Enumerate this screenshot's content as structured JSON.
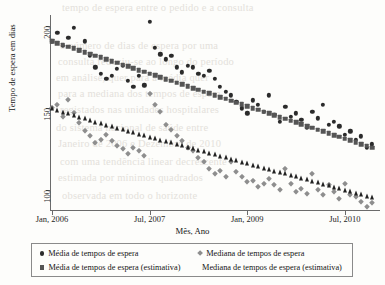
{
  "figure": {
    "background_color": "#fdfdfb",
    "y_axis_title": "Tempo de espera em dias",
    "x_axis_title": "Mês, Ano"
  },
  "bleed_text": [
    {
      "x": 62,
      "y": 2,
      "text": "tempo de espera entre o pedido e a consulta"
    },
    {
      "x": 60,
      "y": 40,
      "text": "o número de dias de espera por uma"
    },
    {
      "x": 58,
      "y": 56,
      "text": "consulta reduziu-se ao longo do período"
    },
    {
      "x": 56,
      "y": 72,
      "text": "em análise, quer para a média quer"
    },
    {
      "x": 58,
      "y": 88,
      "text": "para a mediana dos tempos de espera"
    },
    {
      "x": 60,
      "y": 104,
      "text": "registados nas unidades hospitalares"
    },
    {
      "x": 56,
      "y": 122,
      "text": "do sistema nacional de saúde entre"
    },
    {
      "x": 58,
      "y": 138,
      "text": "Janeiro de 2006 e Dezembro de 2010"
    },
    {
      "x": 60,
      "y": 156,
      "text": "com uma tendência linear decrescente"
    },
    {
      "x": 58,
      "y": 172,
      "text": "estimada por mínimos quadrados"
    },
    {
      "x": 62,
      "y": 190,
      "text": "observada em todo o horizonte"
    }
  ],
  "legend": {
    "entries": [
      {
        "marker": "circle-marker-icon",
        "color": "#2b2b2b",
        "label": "Média de tempos de espera",
        "x": 8,
        "y": 5
      },
      {
        "marker": "square-marker-icon",
        "color": "#555555",
        "label": "Média de tempos de espera (estimativa)",
        "x": 8,
        "y": 19
      },
      {
        "marker": "diamond-marker-icon",
        "color": "#8e8e8e",
        "label": "Mediana de tempos de espera",
        "x": 166,
        "y": 5
      },
      {
        "marker": "triangle-marker-icon",
        "color": "#222222",
        "label": "Mediana de tempos de espera (estimativa)",
        "x": 166,
        "y": 19
      }
    ]
  },
  "chart_data": {
    "type": "scatter",
    "title": "",
    "xlabel": "Mês, Ano",
    "ylabel": "Tempo de espera em dias",
    "xlim": [
      0,
      59
    ],
    "ylim": [
      88,
      207
    ],
    "grid": false,
    "legend_position": "bottom",
    "x_ticks": [
      {
        "value": 0,
        "label": "Jan, 2006"
      },
      {
        "value": 18,
        "label": "Jul, 2007"
      },
      {
        "value": 36,
        "label": "Jan, 2009"
      },
      {
        "value": 54,
        "label": "Jul, 2010"
      }
    ],
    "y_ticks": [
      {
        "value": 200,
        "label": "200"
      },
      {
        "value": 150,
        "label": "150"
      },
      {
        "value": 100,
        "label": "100"
      }
    ],
    "series": [
      {
        "name": "Média de tempos de espera",
        "marker": "circle",
        "color": "#2b2b2b",
        "size": 4.3,
        "x": [
          0,
          1,
          2,
          3,
          4,
          5,
          6,
          7,
          8,
          9,
          10,
          11,
          12,
          13,
          14,
          15,
          16,
          17,
          18,
          19,
          20,
          21,
          22,
          23,
          24,
          25,
          26,
          27,
          28,
          29,
          30,
          31,
          32,
          33,
          34,
          35,
          36,
          37,
          38,
          39,
          40,
          41,
          42,
          43,
          44,
          45,
          46,
          47,
          48,
          49,
          50,
          51,
          52,
          53,
          54,
          55,
          56,
          57,
          58,
          59
        ],
        "values": [
          191,
          196,
          188,
          193,
          199,
          185,
          191,
          182,
          175,
          171,
          168,
          170,
          174,
          176,
          167,
          163,
          170,
          164,
          203,
          187,
          183,
          180,
          182,
          175,
          172,
          176,
          175,
          171,
          170,
          173,
          168,
          163,
          160,
          158,
          154,
          150,
          147,
          155,
          152,
          148,
          158,
          146,
          142,
          151,
          145,
          147,
          143,
          138,
          148,
          144,
          152,
          140,
          142,
          139,
          134,
          136,
          131,
          133,
          126,
          128
        ]
      },
      {
        "name": "Média de tempos de espera (estimativa)",
        "marker": "square",
        "color": "#555555",
        "size": 4.6,
        "x": [
          0,
          1,
          2,
          3,
          4,
          5,
          6,
          7,
          8,
          9,
          10,
          11,
          12,
          13,
          14,
          15,
          16,
          17,
          18,
          19,
          20,
          21,
          22,
          23,
          24,
          25,
          26,
          27,
          28,
          29,
          30,
          31,
          32,
          33,
          34,
          35,
          36,
          37,
          38,
          39,
          40,
          41,
          42,
          43,
          44,
          45,
          46,
          47,
          48,
          49,
          50,
          51,
          52,
          53,
          54,
          55,
          56,
          57,
          58,
          59
        ],
        "values": [
          191.0,
          189.9,
          188.8,
          187.7,
          186.6,
          185.5,
          184.4,
          183.3,
          182.2,
          181.1,
          180.0,
          178.9,
          177.8,
          176.7,
          175.6,
          174.5,
          173.4,
          172.3,
          171.2,
          170.1,
          169.0,
          167.9,
          166.8,
          165.7,
          164.6,
          163.5,
          162.4,
          161.3,
          160.2,
          159.1,
          158.0,
          156.9,
          155.8,
          154.7,
          153.6,
          152.5,
          151.4,
          150.3,
          149.2,
          148.1,
          147.0,
          145.9,
          144.8,
          143.7,
          142.6,
          141.5,
          140.4,
          139.3,
          138.2,
          137.1,
          136.0,
          134.9,
          133.8,
          132.7,
          131.6,
          130.5,
          129.4,
          128.3,
          127.2,
          126.1
        ]
      },
      {
        "name": "Mediana de tempos de espera",
        "marker": "diamond",
        "color": "#8e8e8e",
        "size": 4.4,
        "x": [
          0,
          1,
          2,
          3,
          4,
          5,
          6,
          7,
          8,
          9,
          10,
          11,
          12,
          13,
          14,
          15,
          16,
          17,
          18,
          19,
          20,
          21,
          22,
          23,
          24,
          25,
          26,
          27,
          28,
          29,
          30,
          31,
          32,
          33,
          34,
          35,
          36,
          37,
          38,
          39,
          40,
          41,
          42,
          43,
          44,
          45,
          46,
          47,
          48,
          49,
          50,
          51,
          52,
          53,
          54,
          55,
          56,
          57,
          58,
          59
        ],
        "values": [
          150,
          152,
          145,
          155,
          147,
          141,
          136,
          133,
          129,
          131,
          134,
          130,
          127,
          125,
          122,
          126,
          124,
          121,
          159,
          152,
          148,
          140,
          137,
          133,
          130,
          126,
          124,
          120,
          117,
          113,
          110,
          112,
          108,
          117,
          111,
          108,
          105,
          106,
          102,
          104,
          107,
          103,
          100,
          113,
          104,
          99,
          101,
          98,
          110,
          100,
          97,
          103,
          99,
          95,
          104,
          97,
          96,
          93,
          90,
          92
        ]
      },
      {
        "name": "Mediana de tempos de espera (estimativa)",
        "marker": "triangle",
        "color": "#222222",
        "size": 5.2,
        "x": [
          0,
          1,
          2,
          3,
          4,
          5,
          6,
          7,
          8,
          9,
          10,
          11,
          12,
          13,
          14,
          15,
          16,
          17,
          18,
          19,
          20,
          21,
          22,
          23,
          24,
          25,
          26,
          27,
          28,
          29,
          30,
          31,
          32,
          33,
          34,
          35,
          36,
          37,
          38,
          39,
          40,
          41,
          42,
          43,
          44,
          45,
          46,
          47,
          48,
          49,
          50,
          51,
          52,
          53,
          54,
          55,
          56,
          57,
          58,
          59
        ],
        "values": [
          150.0,
          149.0,
          148.0,
          147.0,
          146.0,
          145.0,
          144.0,
          143.0,
          142.0,
          141.0,
          140.0,
          139.1,
          138.2,
          137.3,
          136.4,
          135.5,
          134.6,
          133.7,
          132.8,
          131.9,
          131.0,
          130.1,
          129.2,
          128.3,
          127.4,
          126.5,
          125.6,
          124.7,
          123.8,
          122.9,
          122.0,
          121.1,
          120.2,
          119.3,
          118.4,
          117.5,
          116.6,
          115.7,
          114.8,
          113.9,
          113.0,
          112.1,
          111.2,
          110.3,
          109.4,
          108.5,
          107.6,
          106.7,
          105.8,
          104.9,
          104.0,
          103.1,
          102.2,
          101.3,
          100.4,
          99.5,
          98.6,
          97.7,
          96.8,
          95.9
        ]
      }
    ]
  }
}
